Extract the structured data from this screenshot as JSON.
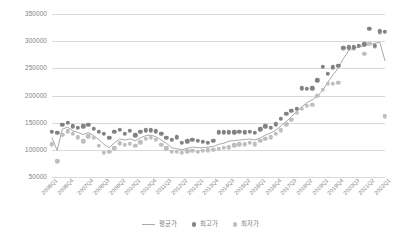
{
  "chart_data": {
    "type": "scatter",
    "title": "",
    "subtitle": "",
    "xlabel": "",
    "ylabel": "",
    "ylim": [
      50000,
      350000
    ],
    "ytick_step": 50000,
    "yticks": [
      "50000",
      "100000",
      "150000",
      "200000",
      "250000",
      "300000",
      "350000"
    ],
    "grid": true,
    "legend_position": "bottom",
    "legend": [
      "평균가",
      "최고가",
      "최저가"
    ],
    "x": [
      "2006Q1",
      "2006Q2",
      "2006Q3",
      "2006Q4",
      "2007Q1",
      "2007Q2",
      "2007Q3",
      "2007Q4",
      "2008Q1",
      "2008Q2",
      "2008Q3",
      "2008Q4",
      "2009Q1",
      "2009Q2",
      "2009Q3",
      "2009Q4",
      "2010Q1",
      "2010Q2",
      "2010Q3",
      "2010Q4",
      "2011Q1",
      "2011Q2",
      "2011Q3",
      "2011Q4",
      "2012Q1",
      "2012Q2",
      "2012Q3",
      "2012Q4",
      "2013Q1",
      "2013Q2",
      "2013Q3",
      "2013Q4",
      "2014Q1",
      "2014Q2",
      "2014Q3",
      "2014Q4",
      "2015Q1",
      "2015Q2",
      "2015Q3",
      "2015Q4",
      "2016Q1",
      "2016Q2",
      "2016Q3",
      "2016Q4",
      "2017Q1",
      "2017Q2",
      "2017Q3",
      "2017Q4",
      "2018Q1",
      "2018Q2",
      "2018Q3",
      "2018Q4",
      "2019Q1",
      "2019Q2",
      "2019Q3",
      "2019Q4",
      "2020Q1",
      "2020Q2",
      "2020Q3",
      "2020Q4",
      "2021Q1",
      "2021Q2",
      "2021Q3",
      "2021Q4",
      "2022Q1"
    ],
    "xtick_labels": [
      "2006Q1",
      "2006Q4",
      "2007Q4",
      "2008Q3",
      "2009Q2",
      "2010Q1",
      "2010Q4",
      "2011Q3",
      "2012Q2",
      "2013Q1",
      "2013Q4",
      "2014Q3",
      "2015Q2",
      "2016Q1",
      "2016Q4",
      "2017Q3",
      "2018Q2",
      "2019Q1",
      "2019Q4",
      "2020Q3",
      "2021Q2",
      "2022Q1"
    ],
    "xtick_indices": [
      0,
      3,
      7,
      10,
      13,
      16,
      19,
      22,
      25,
      28,
      31,
      34,
      37,
      40,
      43,
      46,
      49,
      52,
      55,
      58,
      61,
      64
    ],
    "series": [
      {
        "name": "평균가",
        "type": "line",
        "color": "#a6a8ab",
        "values": [
          122000,
          99000,
          138000,
          142000,
          135000,
          132000,
          128000,
          132000,
          126000,
          119000,
          110000,
          104000,
          113000,
          120000,
          118000,
          120000,
          117000,
          122000,
          126000,
          127000,
          124000,
          118000,
          112000,
          104000,
          102000,
          100000,
          103000,
          105000,
          104000,
          104000,
          105000,
          106000,
          110000,
          112000,
          116000,
          117000,
          118000,
          119000,
          120000,
          118000,
          122000,
          127000,
          131000,
          136000,
          144000,
          152000,
          161000,
          170000,
          179000,
          187000,
          192000,
          199000,
          209000,
          224000,
          238000,
          250000,
          268000,
          282000,
          288000,
          289000,
          292000,
          294000,
          296000,
          298000,
          264000
        ]
      },
      {
        "name": "최고가",
        "type": "scatter",
        "color": "#808285",
        "values": [
          133000,
          131000,
          146000,
          150000,
          143000,
          140000,
          143000,
          146000,
          139000,
          133000,
          130000,
          122000,
          133000,
          137000,
          129000,
          135000,
          127000,
          133000,
          136000,
          136000,
          134000,
          130000,
          122000,
          118000,
          123000,
          113000,
          116000,
          118000,
          117000,
          115000,
          113000,
          117000,
          132000,
          132000,
          132000,
          132000,
          133000,
          132000,
          133000,
          131000,
          138000,
          143000,
          140000,
          147000,
          157000,
          166000,
          172000,
          175000,
          213000,
          212000,
          213000,
          228000,
          253000,
          240000,
          252000,
          255000,
          288000,
          289000,
          289000,
          292000,
          294000,
          323000,
          292000,
          318000,
          317000
        ]
      },
      {
        "name": "최저가",
        "type": "scatter",
        "color": "#bcbec0",
        "values": [
          110000,
          79000,
          128000,
          134000,
          129000,
          123000,
          116000,
          125000,
          122000,
          107000,
          95000,
          96000,
          103000,
          112000,
          109000,
          111000,
          107000,
          114000,
          120000,
          122000,
          119000,
          109000,
          103000,
          96000,
          96000,
          94000,
          97000,
          98000,
          96000,
          98000,
          99000,
          100000,
          102000,
          104000,
          105000,
          108000,
          110000,
          110000,
          113000,
          110000,
          117000,
          120000,
          123000,
          130000,
          136000,
          147000,
          155000,
          168000,
          175000,
          181000,
          183000,
          199000,
          210000,
          222000,
          222000,
          223000,
          286000,
          287000,
          286000,
          291000,
          277000,
          295000,
          290000,
          316000,
          162000
        ]
      }
    ]
  }
}
